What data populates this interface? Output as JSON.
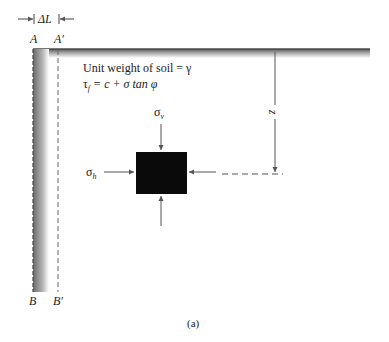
{
  "figure": {
    "caption": "(a)",
    "top_labels": {
      "left": "A",
      "right": "A′"
    },
    "bottom_labels": {
      "left": "B",
      "right": "B′"
    },
    "displacement_label": "ΔL",
    "soil_properties": {
      "unit_weight": "Unit weight of soil = γ",
      "shear_strength": "τ",
      "shear_strength_sub": "f",
      "shear_strength_rhs": " = c + σ tan φ"
    },
    "stress_labels": {
      "vertical": "σ",
      "vertical_sub": "v",
      "horizontal": "σ",
      "horizontal_sub": "h"
    },
    "depth_label": "z",
    "colors": {
      "line": "#555555",
      "element": "#0a0a0a",
      "wall_dark": "#6a6a6a",
      "wall_light": "#ffffff"
    }
  }
}
